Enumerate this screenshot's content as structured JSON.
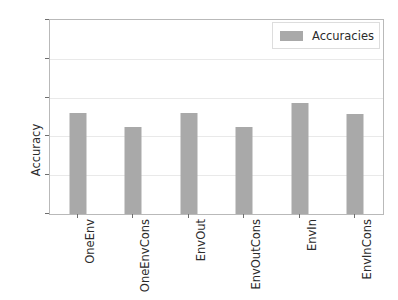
{
  "chart_data": {
    "type": "bar",
    "title": "",
    "subtitle": "",
    "xlabel": "",
    "ylabel": "Accuracy",
    "categories": [
      "OneEnv",
      "OneEnvCons",
      "EnvOut",
      "EnvOutCons",
      "EnvIn",
      "EnvInCons"
    ],
    "values": [
      0.52,
      0.45,
      0.52,
      0.45,
      0.57,
      0.515
    ],
    "series": [
      {
        "name": "Accuracies",
        "values": [
          0.52,
          0.45,
          0.52,
          0.45,
          0.57,
          0.515
        ],
        "color": "#a9a9a9"
      }
    ],
    "ylim": [
      0.0,
      1.0
    ],
    "yticks": [
      "0.0",
      "0.2",
      "0.4",
      "0.6",
      "0.8",
      "1.0"
    ],
    "ytick_values": [
      0.0,
      0.2,
      0.4,
      0.6,
      0.8,
      1.0
    ],
    "grid": true,
    "grid_axis": "y",
    "legend": {
      "entries": [
        "Accuracies"
      ],
      "position": "upper right"
    },
    "xtick_rotation": 90,
    "bar_color": "#a9a9a9",
    "background": "#ffffff",
    "gridline_color": "#e9e9e9",
    "frame_color": "#b9b9b9"
  }
}
